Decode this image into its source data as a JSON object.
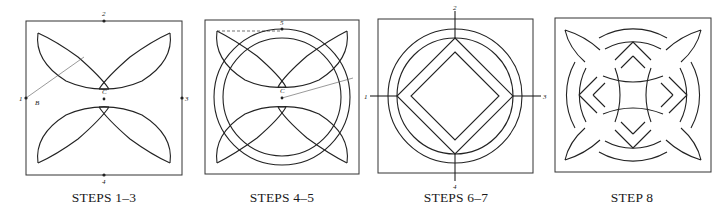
{
  "figure": {
    "panels": [
      {
        "id": "steps-1-3",
        "caption": "STEPS 1–3",
        "point_labels": {
          "top": "2",
          "left": "1",
          "right": "3",
          "bottom": "4",
          "center": "C",
          "compass_mark": "B"
        }
      },
      {
        "id": "steps-4-5",
        "caption": "STEPS 4–5",
        "point_labels": {
          "top": "5",
          "center": "C"
        }
      },
      {
        "id": "steps-6-7",
        "caption": "STEPS 6–7",
        "point_labels": {
          "top": "2",
          "left": "1",
          "right": "3",
          "bottom": "4"
        }
      },
      {
        "id": "step-8",
        "caption": "STEP 8"
      }
    ]
  }
}
